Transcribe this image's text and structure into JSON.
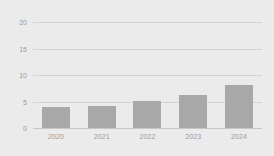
{
  "chart_data": {
    "type": "bar",
    "title": "",
    "subtitle": "",
    "xlabel": "",
    "ylabel": "",
    "categories": [
      "2020",
      "2021",
      "2022",
      "2023",
      "2024"
    ],
    "values": [
      4,
      4.2,
      5.1,
      6.2,
      8.1
    ],
    "series": [
      {
        "name": "",
        "values": [
          4,
          4.2,
          5.1,
          6.2,
          8.1
        ]
      }
    ],
    "ylim": [
      0,
      20
    ],
    "yticks": [
      0,
      5,
      10,
      15,
      20
    ],
    "ytick_labels": [
      "0",
      "5",
      "10",
      "15",
      "20"
    ],
    "grid": true,
    "grid_axis": "y",
    "legend": false,
    "legend_position": "none",
    "annotations": [],
    "colors": {
      "bar": "#a8a8a8",
      "background": "#ebebeb",
      "gridline": "#d4d4d4",
      "baseline": "#c6c6c6",
      "tick_text": "#9a9a9a"
    }
  }
}
